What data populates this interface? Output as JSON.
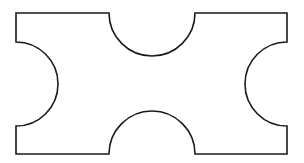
{
  "diagram": {
    "shape": {
      "rect": {
        "x": 16,
        "y": 13,
        "width": 271,
        "height": 141
      },
      "notch_radius_horizontal": 43,
      "notch_radius_vertical": 42,
      "stroke_color": "#1a1a1a",
      "fill_color": "#ffffff",
      "stroke_width": 1.6
    },
    "notches": [
      {
        "side": "top",
        "center": [
          152,
          13
        ]
      },
      {
        "side": "bottom",
        "center": [
          152,
          154
        ]
      },
      {
        "side": "left",
        "center": [
          16,
          84
        ]
      },
      {
        "side": "right",
        "center": [
          287,
          84
        ]
      }
    ]
  }
}
